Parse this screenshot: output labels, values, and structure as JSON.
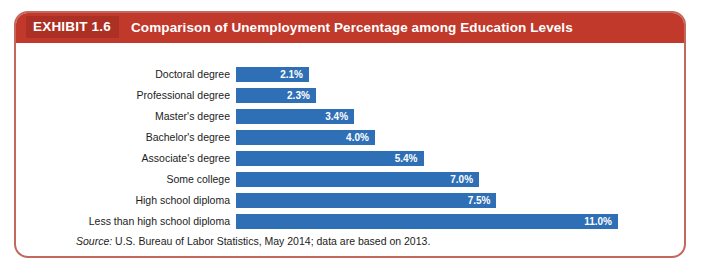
{
  "header": {
    "exhibit_number": "EXHIBIT 1.6",
    "title": "Comparison of Unemployment Percentage among Education Levels",
    "banner_color": "#c0392b",
    "number_block_color": "#ad3024",
    "text_color": "#ffffff"
  },
  "frame": {
    "border_color": "#c4685e"
  },
  "source": {
    "label": "Source:",
    "text": "U.S. Bureau of Labor Statistics, May 2014; data are based on 2013."
  },
  "chart_data": {
    "type": "bar",
    "orientation": "horizontal",
    "title": "Comparison of Unemployment Percentage among Education Levels",
    "xlabel": "",
    "ylabel": "",
    "xlim": [
      0,
      11.0
    ],
    "grid": false,
    "legend": "none",
    "bar_color": "#2f6fb5",
    "value_label_color": "#ffffff",
    "value_suffix": "%",
    "categories": [
      "Doctoral degree",
      "Professional degree",
      "Master's degree",
      "Bachelor's degree",
      "Associate's degree",
      "Some college",
      "High school diploma",
      "Less than high school diploma"
    ],
    "values": [
      2.1,
      2.3,
      3.4,
      4.0,
      5.4,
      7.0,
      7.5,
      11.0
    ],
    "value_labels": [
      "2.1%",
      "2.3%",
      "3.4%",
      "4.0%",
      "5.4%",
      "7.0%",
      "7.5%",
      "11.0%"
    ]
  }
}
